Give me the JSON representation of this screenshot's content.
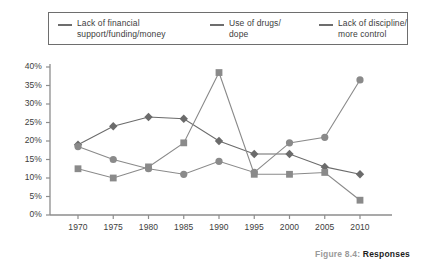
{
  "legend": {
    "items": [
      {
        "label": "Lack of financial\nsupport/funding/money",
        "color": "#6d6d6d",
        "marker": "diamond"
      },
      {
        "label": "Use of drugs/\ndope",
        "color": "#6d6d6d",
        "marker": "square"
      },
      {
        "label": "Lack of discipline/\nmore control",
        "color": "#6d6d6d",
        "marker": "circle"
      }
    ]
  },
  "caption": {
    "prefix": "Figure 8.4:",
    "title": "Responses"
  },
  "chart_data": {
    "type": "line",
    "title": "",
    "xlabel": "",
    "ylabel": "",
    "categories": [
      "1970",
      "1975",
      "1980",
      "1985",
      "1990",
      "1995",
      "2000",
      "2005",
      "2010"
    ],
    "x": [
      1970,
      1975,
      1980,
      1985,
      1990,
      1995,
      2000,
      2005,
      2010
    ],
    "ylim": [
      0,
      40
    ],
    "yticks": [
      "0%",
      "5%",
      "10%",
      "15%",
      "20%",
      "25%",
      "30%",
      "35%",
      "40%"
    ],
    "ytick_values": [
      0,
      5,
      10,
      15,
      20,
      25,
      30,
      35,
      40
    ],
    "grid": false,
    "legend_position": "top",
    "series": [
      {
        "name": "Lack of financial support/funding/money",
        "marker": "diamond",
        "color": "#6b6b6b",
        "values": [
          19,
          24,
          26.5,
          26,
          20,
          16.5,
          16.5,
          13,
          11
        ]
      },
      {
        "name": "Use of drugs/dope",
        "marker": "square",
        "color": "#8a8a8a",
        "values": [
          12.5,
          10,
          13,
          19.5,
          38.5,
          11,
          11,
          11.5,
          4
        ]
      },
      {
        "name": "Lack of discipline/more control",
        "marker": "circle",
        "color": "#8a8a8a",
        "values": [
          18.5,
          15,
          12.5,
          11,
          14.5,
          11.5,
          19.5,
          21,
          36.5
        ]
      }
    ]
  }
}
